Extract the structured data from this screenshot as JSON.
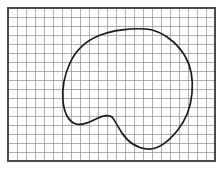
{
  "figure": {
    "background_color": "#ffffff"
  },
  "grid": {
    "name": "graph-paper-grid",
    "origin_x": 8,
    "origin_y": 8,
    "cell_size": 9,
    "columns": 23,
    "rows": 17,
    "width": 207,
    "height": 153,
    "line_color": "#8e8e8e",
    "line_width": 0.7,
    "border_color": "#4a4a4a",
    "border_width": 1.1,
    "paper_color": "#fdfdfd"
  },
  "curve": {
    "name": "region-boundary",
    "stroke_color": "#1a1a1a",
    "stroke_width": 1.7,
    "closed": true,
    "extremes": {
      "leftmost": [
        63,
        90
      ],
      "rightmost": [
        192,
        93
      ],
      "topmost": [
        146,
        29
      ],
      "bottommost": [
        147,
        149
      ]
    },
    "path": "M 146 29 C 160 30 176 41 185 56 C 192 68 193 82 192 93 C 191 106 186 120 177 131 C 168 142 157 150 147 149 C 137 148 128 142 122 133 C 117 125 114 119 112 117 C 108 114 102 116 96 119 C 90 122 82 126 76 124 C 69 122 64 113 63 101 C 62 90 64 76 70 63 C 76 50 86 41 98 36 C 112 30 132 28 146 29 Z"
  },
  "annotations": []
}
